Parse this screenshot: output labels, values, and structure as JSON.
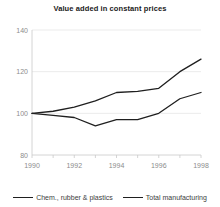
{
  "chart_data": {
    "type": "line",
    "title": "Value added in constant prices",
    "xlabel": "",
    "ylabel": "",
    "x": [
      1990,
      1991,
      1992,
      1993,
      1994,
      1995,
      1996,
      1997,
      1998
    ],
    "xlim": [
      1990,
      1998
    ],
    "ylim": [
      80,
      140
    ],
    "yticks": [
      80,
      100,
      120,
      140
    ],
    "xticks": [
      1990,
      1992,
      1994,
      1996,
      1998
    ],
    "xtick_labels": [
      "1990",
      "1992",
      "1994",
      "1996",
      "1998"
    ],
    "ytick_labels": [
      "80",
      "100",
      "120",
      "140"
    ],
    "grid": true,
    "legend_position": "bottom",
    "series": [
      {
        "name": "Chem., rubber & plastics",
        "color": "#1f1f1f",
        "values": [
          100,
          101,
          103,
          106,
          110,
          110.5,
          112,
          120,
          126
        ]
      },
      {
        "name": "Total manufacturing",
        "color": "#1f1f1f",
        "values": [
          100,
          99,
          98,
          94,
          97,
          97,
          100,
          107,
          110
        ]
      }
    ]
  },
  "legend": {
    "entries": [
      {
        "label": "Chem., rubber & plastics"
      },
      {
        "label": "Total manufacturing"
      }
    ]
  }
}
